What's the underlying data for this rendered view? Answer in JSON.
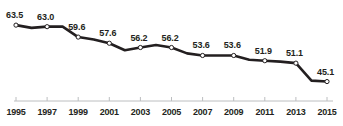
{
  "chart_data": {
    "type": "line",
    "title": "",
    "subtitle": "",
    "xlabel": "",
    "ylabel": "",
    "grid": false,
    "legend": null,
    "xlim": [
      1995,
      2015
    ],
    "ylim": [
      43.0,
      65.5
    ],
    "x": [
      1995,
      1996,
      1997,
      1998,
      1999,
      2000,
      2001,
      2002,
      2003,
      2004,
      2005,
      2006,
      2007,
      2008,
      2009,
      2010,
      2011,
      2012,
      2013,
      2014,
      2015
    ],
    "values": [
      63.5,
      62.6,
      63.0,
      63.0,
      59.6,
      58.8,
      57.6,
      55.3,
      56.2,
      57.0,
      56.2,
      54.3,
      53.6,
      53.6,
      53.6,
      52.2,
      51.9,
      51.6,
      51.1,
      45.4,
      45.1
    ],
    "tick_labels": [
      "1995",
      "1997",
      "1999",
      "2001",
      "2003",
      "2005",
      "2007",
      "2009",
      "2011",
      "2013",
      "2015"
    ],
    "tick_values": [
      1995,
      1997,
      1999,
      2001,
      2003,
      2005,
      2007,
      2009,
      2011,
      2013,
      2015
    ],
    "labeled_points": [
      {
        "x": 1995,
        "value": 63.5,
        "label": "63.5"
      },
      {
        "x": 1997,
        "value": 63.0,
        "label": "63.0"
      },
      {
        "x": 1999,
        "value": 59.6,
        "label": "59.6"
      },
      {
        "x": 2001,
        "value": 57.6,
        "label": "57.6"
      },
      {
        "x": 2003,
        "value": 56.2,
        "label": "56.2"
      },
      {
        "x": 2005,
        "value": 56.2,
        "label": "56.2"
      },
      {
        "x": 2007,
        "value": 53.6,
        "label": "53.6"
      },
      {
        "x": 2009,
        "value": 53.6,
        "label": "53.6"
      },
      {
        "x": 2011,
        "value": 51.9,
        "label": "51.9"
      },
      {
        "x": 2013,
        "value": 51.1,
        "label": "51.1"
      },
      {
        "x": 2015,
        "value": 45.1,
        "label": "45.1"
      }
    ],
    "colors": {
      "line": "#231f20",
      "marker_fill": "#ffffff",
      "marker_stroke": "#231f20",
      "axis": "#bcbec0",
      "text": "#231f20",
      "background": "#ffffff"
    }
  }
}
